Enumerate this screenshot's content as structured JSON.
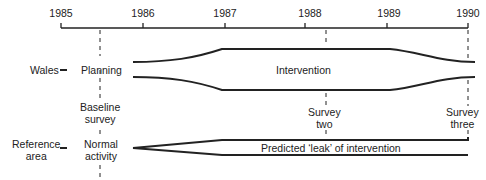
{
  "timeline": {
    "years": [
      "1985",
      "1986",
      "1987",
      "1988",
      "1989",
      "1990"
    ]
  },
  "rows": {
    "wales": {
      "label": "Wales",
      "phase_left": "Planning",
      "band_label": "Intervention"
    },
    "reference": {
      "label_line1": "Reference",
      "label_line2": "area",
      "phase_left_line1": "Normal",
      "phase_left_line2": "activity",
      "band_label": "Predicted ‘leak’ of intervention"
    }
  },
  "surveys": {
    "baseline": {
      "line1": "Baseline",
      "line2": "survey"
    },
    "two": {
      "line1": "Survey",
      "line2": "two"
    },
    "three": {
      "line1": "Survey",
      "line2": "three"
    }
  },
  "colors": {
    "line": "#222222",
    "background": "#ffffff"
  }
}
